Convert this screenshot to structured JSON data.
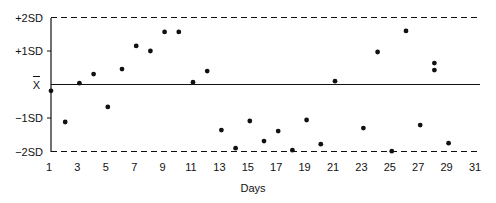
{
  "chart_data": {
    "type": "scatter",
    "title": "",
    "xlabel": "Days",
    "ylabel": "",
    "x_ticks": [
      "1",
      "3",
      "5",
      "7",
      "9",
      "11",
      "13",
      "15",
      "17",
      "19",
      "21",
      "23",
      "25",
      "27",
      "29",
      "31"
    ],
    "xlim": [
      1,
      31
    ],
    "y_ticks": [
      {
        "value": 2,
        "label": "+2SD",
        "style": "dashed"
      },
      {
        "value": 1,
        "label": "+1SD",
        "style": "tick"
      },
      {
        "value": 0,
        "label": "X̄",
        "style": "solid"
      },
      {
        "value": -1,
        "label": "−1SD",
        "style": "tick"
      },
      {
        "value": -2,
        "label": "−2SD",
        "style": "dashed"
      }
    ],
    "ylim": [
      -2,
      2
    ],
    "units": "standard deviations from mean",
    "grid": false,
    "legend": null,
    "points": [
      {
        "x": 1,
        "y": -0.19
      },
      {
        "x": 2,
        "y": -1.12
      },
      {
        "x": 3,
        "y": 0.04
      },
      {
        "x": 4,
        "y": 0.31
      },
      {
        "x": 5,
        "y": -0.67
      },
      {
        "x": 6,
        "y": 0.46
      },
      {
        "x": 7,
        "y": 1.15
      },
      {
        "x": 8,
        "y": 1.0
      },
      {
        "x": 9,
        "y": 1.57
      },
      {
        "x": 10,
        "y": 1.57
      },
      {
        "x": 11,
        "y": 0.07
      },
      {
        "x": 12,
        "y": 0.4
      },
      {
        "x": 13,
        "y": -1.36
      },
      {
        "x": 14,
        "y": -1.9
      },
      {
        "x": 15,
        "y": -1.09
      },
      {
        "x": 16,
        "y": -1.69
      },
      {
        "x": 17,
        "y": -1.39
      },
      {
        "x": 18,
        "y": -1.96
      },
      {
        "x": 19,
        "y": -1.06
      },
      {
        "x": 20,
        "y": -1.78
      },
      {
        "x": 21,
        "y": 0.1
      },
      {
        "x": 23,
        "y": -1.3
      },
      {
        "x": 24,
        "y": 0.97
      },
      {
        "x": 25,
        "y": -1.99
      },
      {
        "x": 26,
        "y": 1.6
      },
      {
        "x": 27,
        "y": -1.21
      },
      {
        "x": 28,
        "y": 0.64
      },
      {
        "x": 28,
        "y": 0.43
      },
      {
        "x": 29,
        "y": -1.75
      }
    ]
  },
  "colors": {
    "ink": "#111111",
    "background": "#ffffff"
  }
}
